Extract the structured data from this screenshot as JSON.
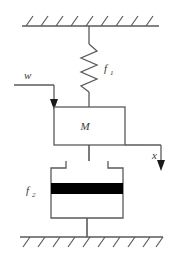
{
  "figure": {
    "type": "mechanical-schematic",
    "background_color": "#ffffff",
    "line_color": "#5a5a5a",
    "dark_line_color": "#3a3a3a",
    "fill_color": "#000000"
  },
  "labels": {
    "spring": {
      "symbol": "f",
      "subscript": "1",
      "text": "f1"
    },
    "damper": {
      "symbol": "f",
      "subscript": "2",
      "text": "f2"
    },
    "mass": {
      "text": "M"
    },
    "input": {
      "text": "w"
    },
    "output": {
      "text": "x"
    }
  },
  "components": {
    "ceiling": {
      "name": "fixed-support-top",
      "label": ""
    },
    "floor": {
      "name": "fixed-support-bottom",
      "label": ""
    },
    "spring": {
      "name": "spring-element",
      "coils": 5
    },
    "mass_block": {
      "name": "mass-block",
      "label": "M"
    },
    "dashpot": {
      "name": "dashpot-element",
      "piston_color": "#000000"
    },
    "input_arrow": {
      "name": "input-force-arrow",
      "label": "w",
      "direction": "down"
    },
    "output_arrow": {
      "name": "displacement-arrow",
      "label": "x",
      "direction": "down"
    }
  }
}
